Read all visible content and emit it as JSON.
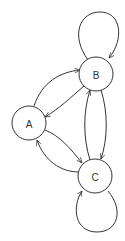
{
  "diagram": {
    "type": "directed-graph",
    "nodes": [
      {
        "id": "A",
        "label": "A"
      },
      {
        "id": "B",
        "label": "B"
      },
      {
        "id": "C",
        "label": "C"
      }
    ],
    "edges": [
      {
        "from": "A",
        "to": "B"
      },
      {
        "from": "B",
        "to": "A"
      },
      {
        "from": "A",
        "to": "C"
      },
      {
        "from": "C",
        "to": "A"
      },
      {
        "from": "B",
        "to": "C"
      },
      {
        "from": "C",
        "to": "B"
      },
      {
        "from": "B",
        "to": "B"
      },
      {
        "from": "C",
        "to": "C"
      }
    ],
    "colors": {
      "stroke": "#333333",
      "background": "#ffffff"
    }
  }
}
